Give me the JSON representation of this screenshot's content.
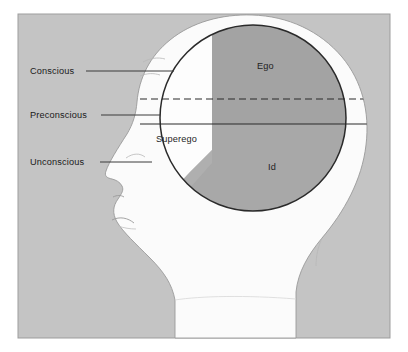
{
  "awareness_labels": [
    {
      "id": "conscious",
      "text": "Conscious",
      "x": 30,
      "y": 74,
      "line_x1": 86,
      "line_x2": 172,
      "line_y": 71
    },
    {
      "id": "preconscious",
      "text": "Preconscious",
      "x": 30,
      "y": 118,
      "line_x1": 101,
      "line_x2": 160,
      "line_y": 115
    },
    {
      "id": "unconscious",
      "text": "Unconscious",
      "x": 30,
      "y": 165,
      "line_x1": 100,
      "line_x2": 152,
      "line_y": 162
    }
  ],
  "psyche_regions": [
    {
      "id": "ego",
      "text": "Ego",
      "x": 257,
      "y": 69,
      "color": "#a3a3a3"
    },
    {
      "id": "superego",
      "text": "Superego",
      "x": 156,
      "y": 142,
      "color": "#ffffff"
    },
    {
      "id": "id",
      "text": "Id",
      "x": 268,
      "y": 170,
      "color": "#a8a8a8"
    }
  ],
  "divider_lines": {
    "preconscious_boundary": {
      "style": "dashed",
      "y": 99,
      "x1": 152,
      "x2": 350,
      "color": "#2a2a2a"
    },
    "unconscious_boundary": {
      "style": "solid",
      "y": 124,
      "x1": 148,
      "x2": 352,
      "color": "#2a2a2a"
    }
  },
  "colors": {
    "page_background": "#ffffff",
    "panel_background": "#c4c4c4",
    "panel_border": "#9a9a9a",
    "head_fill": "#fbfbfb",
    "head_outline": "#8f8f8f",
    "circle_outline": "#2a2a2a",
    "ego_fill": "#a3a3a3",
    "id_fill": "#a8a8a8",
    "superego_fill": "#fdfdfd",
    "leader_line": "#3a3a3a",
    "text": "#1a1a1a"
  },
  "panel": {
    "x": 18,
    "y": 14,
    "width": 372,
    "height": 324
  },
  "circle": {
    "cx": 253,
    "cy": 118,
    "r": 93
  }
}
